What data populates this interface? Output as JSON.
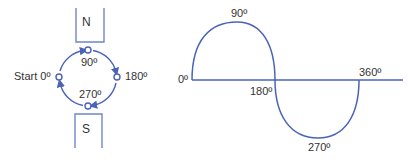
{
  "generator": {
    "north_label": "N",
    "south_label": "S",
    "positions": {
      "start": "Start 0º",
      "top": "90º",
      "right": "180º",
      "bottom": "270º"
    }
  },
  "waveform": {
    "labels": {
      "zero": "0º",
      "peak": "90º",
      "cross": "180º",
      "trough": "270º",
      "end": "360º"
    }
  },
  "colors": {
    "line": "#4a63b8",
    "magnet": "#6f86c9",
    "text": "#333333"
  }
}
